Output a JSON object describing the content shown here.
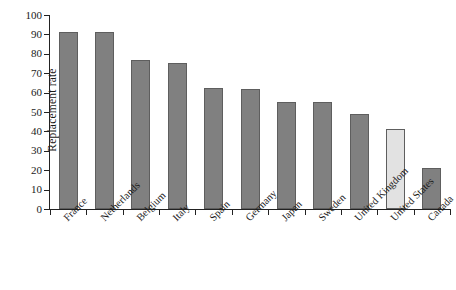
{
  "chart_data": {
    "type": "bar",
    "title": "",
    "xlabel": "",
    "ylabel": "Replacement rate",
    "ylim": [
      0,
      100
    ],
    "yticks": [
      0,
      10,
      20,
      30,
      40,
      50,
      60,
      70,
      80,
      90,
      100
    ],
    "grid": false,
    "legend": "none",
    "orientation": "vertical",
    "tick_label_rotation_deg": -45,
    "categories": [
      "France",
      "Netherlands",
      "Belgium",
      "Italy",
      "Spain",
      "Germany",
      "Japan",
      "Sweden",
      "United Kingdom",
      "United States",
      "Canada"
    ],
    "values": [
      91,
      91,
      77,
      75.5,
      62.5,
      62,
      55,
      55,
      49,
      41,
      21
    ],
    "highlight_category": "United States",
    "bar_color": "#808080",
    "highlight_bar_color": "#e2e2e2",
    "bar_edge_color": "#5e5e5e",
    "axis_color": "#222222",
    "background_color": "#ffffff"
  }
}
